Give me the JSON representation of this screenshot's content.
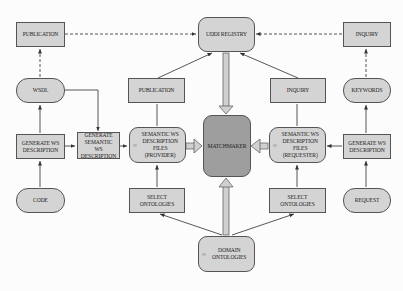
{
  "diagram": {
    "nodes": {
      "publication_left": {
        "label": "PUBLICATION"
      },
      "uddi_registry": {
        "label": "UDDI REGISTRY"
      },
      "inquiry_right": {
        "label": "INQUIRY"
      },
      "wsdl": {
        "label": "WSDL"
      },
      "publication_mid": {
        "label": "PUBLICATION"
      },
      "inquiry_mid": {
        "label": "INQUIRY"
      },
      "keywords": {
        "label": "KEYWORDS"
      },
      "generate_ws_left": {
        "label": "GENERATE WS DESCRIPTION"
      },
      "generate_semantic": {
        "label": "GENERATE SEMANTIC WS DESCRIPTION"
      },
      "semantic_provider": {
        "label": "SEMANTIC WS DESCRIPTION FILES (PROVIDER)"
      },
      "matchmaker": {
        "label": "MATCHMAKER"
      },
      "semantic_requester": {
        "label": "SEMANTIC WS DESCRIPTION FILES (REQUESTER)"
      },
      "generate_ws_right": {
        "label": "GENERATE WS DESCRIPTION"
      },
      "code": {
        "label": "CODE"
      },
      "select_ontologies_left": {
        "label": "SELECT ONTOLOGIES"
      },
      "select_ontologies_right": {
        "label": "SELECT ONTOLOGIES"
      },
      "request": {
        "label": "REQUEST"
      },
      "domain_ontologies": {
        "label": "DOMAIN ONTOLOGIES"
      }
    },
    "icons": {
      "doc": "☼"
    },
    "colors": {
      "node_fill": "#d4d4d4",
      "matchmaker_fill": "#9e9e9e",
      "stroke": "#555555"
    }
  }
}
